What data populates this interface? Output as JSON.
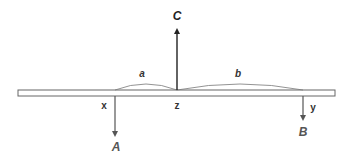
{
  "diagram": {
    "beam": {
      "x1": 18,
      "x2": 335,
      "y_top": 90,
      "y_bottom": 96
    },
    "forces": [
      {
        "id": "C",
        "label": "C",
        "direction": "up",
        "x": 177,
        "from_y": 90,
        "to_y": 28,
        "label_x": 177,
        "label_y": 20,
        "color": "#222222"
      },
      {
        "id": "A",
        "label": "A",
        "direction": "down",
        "x": 115,
        "from_y": 96,
        "to_y": 137,
        "label_x": 116,
        "label_y": 151,
        "color": "#555555"
      },
      {
        "id": "B",
        "label": "B",
        "direction": "down",
        "x": 303,
        "from_y": 96,
        "to_y": 121,
        "label_x": 303,
        "label_y": 136,
        "color": "#555555"
      }
    ],
    "points": [
      {
        "id": "x",
        "label": "x",
        "x": 104,
        "y": 109
      },
      {
        "id": "z",
        "label": "z",
        "x": 177,
        "y": 109
      },
      {
        "id": "y",
        "label": "y",
        "x": 313,
        "y": 111
      }
    ],
    "distances": [
      {
        "id": "a",
        "label": "a",
        "from_x": 115,
        "to_x": 177,
        "label_x": 142,
        "label_y": 77
      },
      {
        "id": "b",
        "label": "b",
        "from_x": 177,
        "to_x": 303,
        "label_x": 238,
        "label_y": 77
      }
    ]
  }
}
